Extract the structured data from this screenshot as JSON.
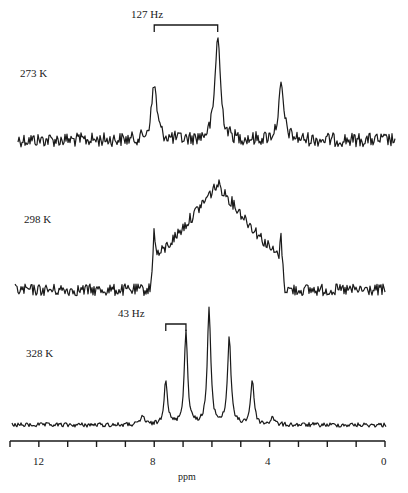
{
  "chart_data": {
    "type": "line",
    "title": "",
    "xlabel": "ppm",
    "ylabel": "",
    "xlim": [
      13,
      0
    ],
    "x_reversed": true,
    "grid": false,
    "legend": null,
    "x_ticks": [
      13,
      12,
      11,
      10,
      9,
      8,
      7,
      6,
      5,
      4,
      3,
      2,
      1,
      0
    ],
    "x_tick_labels": [
      "12",
      "8",
      "4",
      "0"
    ],
    "x_tick_label_values": [
      12,
      8,
      4,
      0
    ],
    "series": [
      {
        "name": "273 K",
        "peaks": [
          {
            "ppm": 8.0,
            "rel_height": 0.53
          },
          {
            "ppm": 5.8,
            "rel_height": 1.0
          },
          {
            "ppm": 3.6,
            "rel_height": 0.5
          }
        ],
        "annotation": {
          "text": "127 Hz",
          "from_ppm": 8.0,
          "to_ppm": 5.8
        }
      },
      {
        "name": "298 K",
        "shape": "broad hump centered ~5.8 ppm spanning ~8.0–3.6 ppm with sharp spikes at edges",
        "peaks": [
          {
            "ppm": 8.0,
            "rel_height": 0.72
          },
          {
            "ppm": 5.8,
            "rel_height": 1.0
          },
          {
            "ppm": 3.6,
            "rel_height": 0.63
          }
        ]
      },
      {
        "name": "328 K",
        "peaks": [
          {
            "ppm": 8.4,
            "rel_height": 0.08
          },
          {
            "ppm": 7.6,
            "rel_height": 0.39
          },
          {
            "ppm": 6.9,
            "rel_height": 0.8
          },
          {
            "ppm": 6.1,
            "rel_height": 1.0
          },
          {
            "ppm": 5.4,
            "rel_height": 0.76
          },
          {
            "ppm": 4.6,
            "rel_height": 0.39
          },
          {
            "ppm": 3.9,
            "rel_height": 0.07
          }
        ],
        "annotation": {
          "text": "43 Hz",
          "from_ppm": 7.6,
          "to_ppm": 6.9
        }
      }
    ]
  },
  "labels": {
    "t1": "273 K",
    "t2": "298 K",
    "t3": "328 K",
    "j1": "127 Hz",
    "j2": "43 Hz",
    "xlabel": "ppm",
    "tick12": "12",
    "tick8": "8",
    "tick4": "4",
    "tick0": "0"
  },
  "colors": {
    "ink": "#1a1a1a",
    "background": "#ffffff"
  }
}
